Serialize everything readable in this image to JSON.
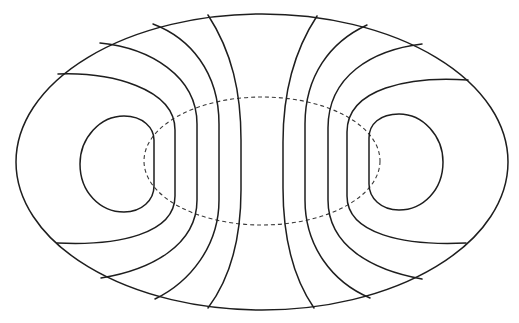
{
  "diagram": {
    "type": "field-line contour diagram",
    "background": "#ffffff",
    "stroke_color": "#1e1e1e",
    "dashed_color": "#3a3a3a",
    "outer_boundary": {
      "shape": "ellipse",
      "cx": 262,
      "cy": 162,
      "rx": 246,
      "ry": 148,
      "style": "solid"
    },
    "inner_region": {
      "shape": "ellipse",
      "cx": 262,
      "cy": 161,
      "rx": 118,
      "ry": 64,
      "style": "dashed"
    },
    "left_closed_loop": {
      "style": "solid",
      "bbox": [
        80,
        116,
        154,
        212
      ]
    },
    "right_closed_loop": {
      "style": "solid",
      "bbox": [
        368,
        114,
        443,
        210
      ]
    },
    "left_field_lines": 4,
    "right_field_lines": 4,
    "text_labels": []
  }
}
